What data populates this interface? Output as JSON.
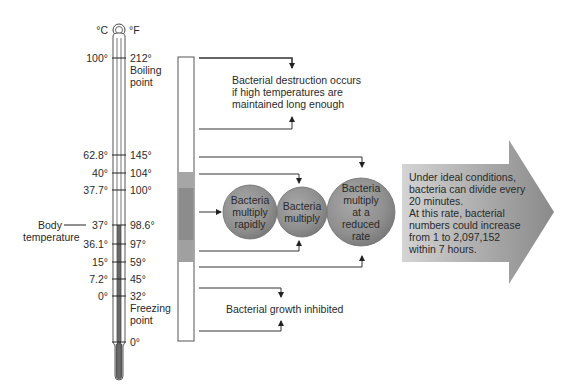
{
  "thermometer": {
    "unit_left": "°C",
    "unit_right": "°F",
    "ticks": [
      {
        "c": "100°",
        "f": "212°",
        "y": 58
      },
      {
        "c": "62.8°",
        "f": "145°",
        "y": 155
      },
      {
        "c": "40°",
        "f": "104°",
        "y": 173
      },
      {
        "c": "37.7°",
        "f": "100°",
        "y": 190
      },
      {
        "c": "37°",
        "f": "98.6°",
        "y": 225
      },
      {
        "c": "36.1°",
        "f": "97°",
        "y": 244
      },
      {
        "c": "15°",
        "f": "59°",
        "y": 262
      },
      {
        "c": "7.2°",
        "f": "45°",
        "y": 279
      },
      {
        "c": "0°",
        "f": "32°",
        "y": 296
      },
      {
        "c": "",
        "f": "0°",
        "y": 342
      }
    ],
    "boiling_label_1": "Boiling",
    "boiling_label_2": "point",
    "freezing_label_1": "Freezing",
    "freezing_label_2": "point",
    "body_temp_label_1": "Body",
    "body_temp_label_2": "temperature"
  },
  "zones": {
    "destruction": "Bacterial destruction occurs if high temperatures are maintained long enough",
    "destruction_lines": [
      "Bacterial destruction occurs",
      "if high temperatures are",
      "maintained long enough"
    ],
    "inhibited": "Bacterial growth inhibited"
  },
  "circles": [
    {
      "lines": [
        "Bacteria",
        "multiply",
        "rapidly"
      ]
    },
    {
      "lines": [
        "Bacteria",
        "multiply"
      ]
    },
    {
      "lines": [
        "Bacteria",
        "multiply",
        "at a",
        "reduced",
        "rate"
      ]
    }
  ],
  "callout": {
    "lines": [
      "Under ideal conditions,",
      "bacteria can divide every",
      "20 minutes.",
      "At this rate, bacterial",
      "numbers could increase",
      "from 1 to 2,097,152",
      "within 7 hours."
    ]
  },
  "colors": {
    "line": "#333333",
    "bar_light": "#a9a9a9",
    "bar_dark": "#8c8c8c",
    "circle": "#8e8e8e",
    "arrow_light": "#cfcfcf",
    "arrow_dark": "#8a8a8a"
  }
}
